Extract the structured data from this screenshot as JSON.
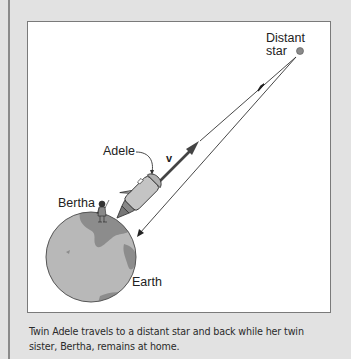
{
  "figure": {
    "labels": {
      "distant_star_line1": "Distant",
      "distant_star_line2": "star",
      "adele": "Adele",
      "velocity": "v",
      "bertha": "Bertha",
      "earth": "Earth"
    },
    "caption": "Twin Adele travels to a distant star and back while her twin sister, Bertha, remains at home."
  },
  "colors": {
    "background": "#e2e2e2",
    "panel": "#ffffff",
    "earth_ocean": "#b8b8b8",
    "earth_land": "#8c8c8c",
    "star": "#8a8a8a"
  }
}
